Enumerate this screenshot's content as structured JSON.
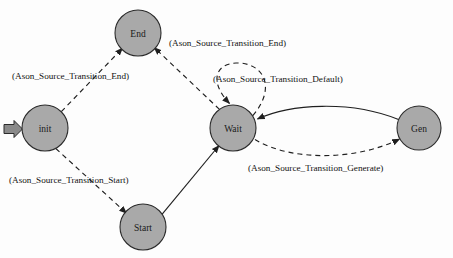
{
  "diagram": {
    "background_color": "#fdfdfd",
    "node_fill": "#a9a9a9",
    "node_stroke": "#2b2b2b",
    "edge_color": "#1f1f1f",
    "nodes": [
      {
        "id": "end",
        "label": "End",
        "cx": 138,
        "cy": 33,
        "r": 23
      },
      {
        "id": "init",
        "label": "init",
        "cx": 45,
        "cy": 128,
        "r": 23
      },
      {
        "id": "wait",
        "label": "Wait",
        "cx": 233,
        "cy": 128,
        "r": 23
      },
      {
        "id": "gen",
        "label": "Gen",
        "cx": 419,
        "cy": 128,
        "r": 22
      },
      {
        "id": "start",
        "label": "Start",
        "cx": 143,
        "cy": 227,
        "r": 23
      }
    ],
    "entry_marker": {
      "target": "init",
      "shape": "block-arrow"
    },
    "edges": [
      {
        "id": "init-end",
        "from": "init",
        "to": "end",
        "style": "dashed",
        "label": "(Ason_Source_Transition_End)",
        "label_x": 12,
        "label_y": 77
      },
      {
        "id": "wait-end",
        "from": "wait",
        "to": "end",
        "style": "dashed",
        "label": "(Ason_Source_Transition_End)",
        "label_x": 169,
        "label_y": 44
      },
      {
        "id": "wait-wait",
        "from": "wait",
        "to": "wait",
        "style": "dashed",
        "label": "(Ason_Source_Transition_Default)",
        "label_x": 213,
        "label_y": 80
      },
      {
        "id": "init-start",
        "from": "init",
        "to": "start",
        "style": "dashed",
        "label": "(Ason_Source_Transition_Start)",
        "label_x": 9,
        "label_y": 181
      },
      {
        "id": "start-wait",
        "from": "start",
        "to": "wait",
        "style": "solid",
        "label": "",
        "label_x": 0,
        "label_y": 0
      },
      {
        "id": "gen-wait",
        "from": "gen",
        "to": "wait",
        "style": "solid",
        "label": "",
        "label_x": 0,
        "label_y": 0
      },
      {
        "id": "wait-gen",
        "from": "wait",
        "to": "gen",
        "style": "dashed",
        "label": "(Ason_Source_Transition_Generate)",
        "label_x": 248,
        "label_y": 169
      }
    ]
  }
}
